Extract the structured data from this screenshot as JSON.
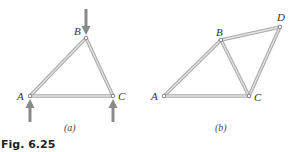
{
  "figure": {
    "caption": "Fig. 6.25",
    "panels": [
      {
        "id": "a",
        "label": "(a)",
        "joints": [
          {
            "name": "A",
            "label": "A"
          },
          {
            "name": "B",
            "label": "B"
          },
          {
            "name": "C",
            "label": "C"
          }
        ],
        "members": [
          [
            "A",
            "B"
          ],
          [
            "B",
            "C"
          ],
          [
            "A",
            "C"
          ]
        ],
        "loads": [
          {
            "joint": "B",
            "direction": "down"
          },
          {
            "joint": "A",
            "direction": "up"
          },
          {
            "joint": "C",
            "direction": "up"
          }
        ]
      },
      {
        "id": "b",
        "label": "(b)",
        "joints": [
          {
            "name": "A",
            "label": "A"
          },
          {
            "name": "B",
            "label": "B"
          },
          {
            "name": "C",
            "label": "C"
          },
          {
            "name": "D",
            "label": "D"
          }
        ],
        "members": [
          [
            "A",
            "B"
          ],
          [
            "B",
            "C"
          ],
          [
            "A",
            "C"
          ],
          [
            "B",
            "D"
          ],
          [
            "C",
            "D"
          ]
        ],
        "loads": []
      }
    ]
  },
  "colors": {
    "member": "#a9a9a9",
    "member_highlight": "#e4e4e4",
    "arrow": "#8a8a8a",
    "text": "#333333"
  }
}
